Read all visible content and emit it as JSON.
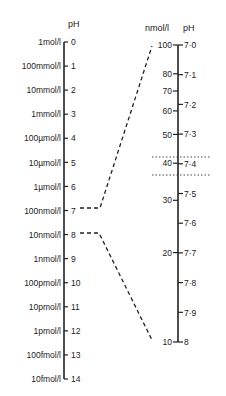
{
  "left_scale": {
    "header": "pH",
    "rows": [
      {
        "conc": "1mol/l",
        "ph": "0"
      },
      {
        "conc": "100mmol/l",
        "ph": "1"
      },
      {
        "conc": "10mmol/l",
        "ph": "2"
      },
      {
        "conc": "1mmol/l",
        "ph": "3"
      },
      {
        "conc": "100µmol/l",
        "ph": "4"
      },
      {
        "conc": "10µmol/l",
        "ph": "5"
      },
      {
        "conc": "1µmol/l",
        "ph": "6"
      },
      {
        "conc": "100nmol/l",
        "ph": "7"
      },
      {
        "conc": "10nmol/l",
        "ph": "8"
      },
      {
        "conc": "1nmol/l",
        "ph": "9"
      },
      {
        "conc": "100pmol/l",
        "ph": "10"
      },
      {
        "conc": "10pmol/l",
        "ph": "11"
      },
      {
        "conc": "1pmol/l",
        "ph": "12"
      },
      {
        "conc": "100fmol/l",
        "ph": "13"
      },
      {
        "conc": "10fmol/l",
        "ph": "14"
      }
    ]
  },
  "right_scale": {
    "header_conc": "nmol/l",
    "header_ph": "pH",
    "ph_ticks": [
      "7·0",
      "7·1",
      "7·2",
      "7·3",
      "7·4",
      "7·5",
      "7·6",
      "7·7",
      "7·8",
      "7·9",
      "8"
    ],
    "conc_ticks": [
      "100",
      "80",
      "70",
      "60",
      "50",
      "40",
      "30",
      "20",
      "10"
    ]
  },
  "colors": {
    "ink": "#222222",
    "background": "#ffffff"
  }
}
